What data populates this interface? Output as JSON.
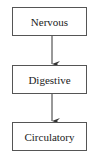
{
  "diagram": {
    "type": "flowchart",
    "nodes": [
      {
        "id": "n1",
        "label": "Nervous"
      },
      {
        "id": "n2",
        "label": "Digestive"
      },
      {
        "id": "n3",
        "label": "Circulatory"
      }
    ],
    "edges": [
      {
        "from": "n1",
        "to": "n2"
      },
      {
        "from": "n2",
        "to": "n3"
      }
    ],
    "colors": {
      "border": "#555555",
      "text": "#222222",
      "background": "#ffffff"
    }
  }
}
